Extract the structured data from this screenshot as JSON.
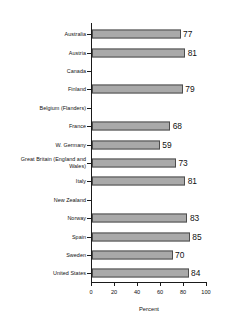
{
  "chart_data": {
    "type": "bar",
    "orientation": "horizontal",
    "title": "",
    "xlabel": "Percent",
    "ylabel": "",
    "xlim": [
      0,
      100
    ],
    "xticks": [
      0,
      20,
      40,
      60,
      80,
      100
    ],
    "grid": false,
    "legend": null,
    "categories": [
      "Australia",
      "Austria",
      "Canada",
      "Finland",
      "Belgium (Flanders)",
      "France",
      "W. Germany",
      "Great Britain (England and\nWales)",
      "Italy",
      "New Zealand",
      "Norway",
      "Spain",
      "Sweden",
      "United States"
    ],
    "values": [
      77,
      81,
      null,
      79,
      null,
      68,
      59,
      73,
      81,
      null,
      83,
      85,
      70,
      84
    ],
    "value_labels": [
      "77",
      "81",
      "",
      "79",
      "",
      "68",
      "59",
      "73",
      "81",
      "",
      "83",
      "85",
      "70",
      "84"
    ],
    "bar_fill_color": "#a9a9a9",
    "bar_border_color": "#4d4d4d",
    "axis_color": "#1a1a1a",
    "background_color": "#ffffff"
  }
}
